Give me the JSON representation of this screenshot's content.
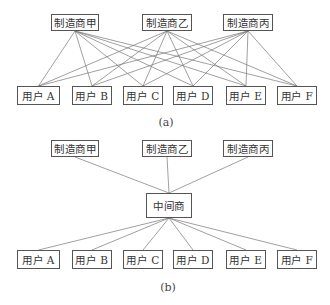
{
  "diagram_a": {
    "caption": "(a)",
    "manufacturers": [
      {
        "label": "制造商甲",
        "x": 51,
        "y": 14,
        "w": 48,
        "h": 17
      },
      {
        "label": "制造商乙",
        "x": 142,
        "y": 14,
        "w": 50,
        "h": 17
      },
      {
        "label": "制造商丙",
        "x": 223,
        "y": 14,
        "w": 50,
        "h": 17
      }
    ],
    "users": [
      {
        "label": "用户 A",
        "x": 17,
        "y": 86,
        "w": 43,
        "h": 19
      },
      {
        "label": "用户 B",
        "x": 72,
        "y": 86,
        "w": 40,
        "h": 19
      },
      {
        "label": "用户 C",
        "x": 123,
        "y": 86,
        "w": 40,
        "h": 19
      },
      {
        "label": "用户 D",
        "x": 173,
        "y": 86,
        "w": 40,
        "h": 19
      },
      {
        "label": "用户 E",
        "x": 226,
        "y": 86,
        "w": 40,
        "h": 19
      },
      {
        "label": "用户 F",
        "x": 277,
        "y": 86,
        "w": 40,
        "h": 19
      }
    ],
    "connections": "every manufacturer connected to every user"
  },
  "diagram_b": {
    "caption": "(b)",
    "manufacturers": [
      {
        "label": "制造商甲",
        "x": 51,
        "y": 140,
        "w": 48,
        "h": 17
      },
      {
        "label": "制造商乙",
        "x": 142,
        "y": 140,
        "w": 50,
        "h": 17
      },
      {
        "label": "制造商丙",
        "x": 223,
        "y": 140,
        "w": 50,
        "h": 17
      }
    ],
    "intermediary": {
      "label": "中间商",
      "x": 146,
      "y": 193,
      "w": 46,
      "h": 25
    },
    "users": [
      {
        "label": "用户 A",
        "x": 17,
        "y": 250,
        "w": 43,
        "h": 19
      },
      {
        "label": "用户 B",
        "x": 72,
        "y": 250,
        "w": 40,
        "h": 19
      },
      {
        "label": "用户 C",
        "x": 123,
        "y": 250,
        "w": 40,
        "h": 19
      },
      {
        "label": "用户 D",
        "x": 173,
        "y": 250,
        "w": 40,
        "h": 19
      },
      {
        "label": "用户 E",
        "x": 226,
        "y": 250,
        "w": 40,
        "h": 19
      },
      {
        "label": "用户 F",
        "x": 277,
        "y": 250,
        "w": 40,
        "h": 19
      }
    ],
    "connections": "each manufacturer connected to intermediary; intermediary connected to each user"
  },
  "colors": {
    "line": "#777777",
    "border": "#555555",
    "text": "#333333"
  }
}
